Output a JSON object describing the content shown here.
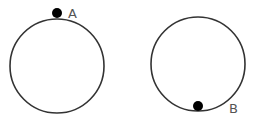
{
  "diagram": {
    "circles": [
      {
        "id": "left",
        "point_label": "A",
        "point_position": "top"
      },
      {
        "id": "right",
        "point_label": "B",
        "point_position": "bottom"
      }
    ],
    "colors": {
      "stroke": "#333333",
      "dot": "#000000",
      "label": "#555555"
    }
  }
}
